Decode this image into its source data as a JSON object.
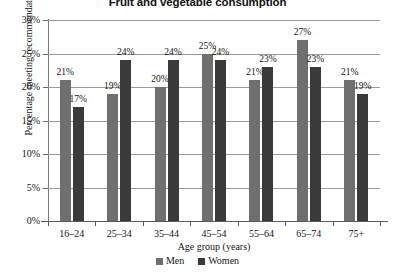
{
  "chart_data": {
    "type": "bar",
    "title": "Fruit and vegetable consumption",
    "xlabel": "Age group (years)",
    "ylabel": "Percentage meeting recommendations",
    "categories": [
      "16–24",
      "25–34",
      "35–44",
      "45–54",
      "55–64",
      "65–74",
      "75+"
    ],
    "series": [
      {
        "name": "Men",
        "color": "#6f6f6f",
        "values": [
          21,
          19,
          20,
          25,
          21,
          27,
          21
        ]
      },
      {
        "name": "Women",
        "color": "#3a3a3a",
        "values": [
          17,
          24,
          24,
          24,
          23,
          23,
          19
        ]
      }
    ],
    "value_labels": [
      [
        "21%",
        "19%",
        "20%",
        "25%",
        "21%",
        "27%",
        "21%"
      ],
      [
        "17%",
        "24%",
        "24%",
        "24%",
        "23%",
        "23%",
        "19%"
      ]
    ],
    "ylim": [
      0,
      30
    ],
    "ytick_values": [
      0,
      5,
      10,
      15,
      20,
      25,
      30
    ],
    "ytick_labels": [
      "0%",
      "5%",
      "10%",
      "15%",
      "20%",
      "25%",
      "30%"
    ],
    "grid": true,
    "legend_position": "bottom",
    "legend": [
      "Men",
      "Women"
    ]
  }
}
